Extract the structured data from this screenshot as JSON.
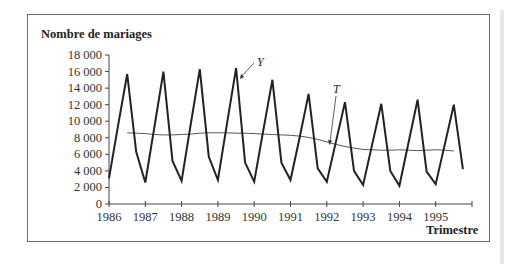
{
  "chart_data": {
    "type": "line",
    "title": "",
    "ylabel": "Nombre de mariages",
    "xlabel": "Trimestre",
    "ylim": [
      0,
      18000
    ],
    "xlim": [
      1986,
      1996
    ],
    "grid": false,
    "legend_position": "inline-annotations",
    "yticks": [
      0,
      2000,
      4000,
      6000,
      8000,
      10000,
      12000,
      14000,
      16000,
      18000
    ],
    "ytick_labels": [
      "0",
      "2 000",
      "4 000",
      "6 000",
      "8 000",
      "10 000",
      "12 000",
      "14 000",
      "16 000",
      "18 000"
    ],
    "xticks": [
      1986,
      1987,
      1988,
      1989,
      1990,
      1991,
      1992,
      1993,
      1994,
      1995,
      1996
    ],
    "xtick_labels": [
      "1986",
      "1987",
      "1988",
      "1989",
      "1990",
      "1991",
      "1992",
      "1993",
      "1994",
      "1995",
      ""
    ],
    "series": [
      {
        "name": "Y",
        "description": "Nombre de mariages trimestriel",
        "start": 1986,
        "step": 0.25,
        "values": [
          3100,
          9500,
          15700,
          6300,
          2600,
          9300,
          16000,
          5200,
          2800,
          9600,
          16300,
          5700,
          2900,
          9700,
          16400,
          5000,
          2700,
          8900,
          15000,
          5000,
          2900,
          8000,
          13300,
          4300,
          2700,
          7500,
          12300,
          4000,
          2300,
          7200,
          12100,
          4000,
          2200,
          7400,
          12600,
          3900,
          2400,
          7200,
          12000,
          4200
        ],
        "color": "#222222",
        "line_width": 2
      },
      {
        "name": "T",
        "description": "Tendance (moyenne mobile)",
        "start": 1986.5,
        "step": 0.25,
        "values": [
          8600,
          8550,
          8500,
          8400,
          8350,
          8350,
          8400,
          8450,
          8550,
          8600,
          8600,
          8600,
          8550,
          8550,
          8500,
          8450,
          8400,
          8350,
          8300,
          8200,
          8050,
          7800,
          7500,
          7200,
          6950,
          6750,
          6600,
          6550,
          6500,
          6500,
          6550,
          6500,
          6450,
          6500,
          6550,
          6500,
          6400
        ],
        "color": "#444444",
        "line_width": 1
      }
    ],
    "annotations": [
      {
        "text": "Y",
        "points_to": "peak 1989 Q3"
      },
      {
        "text": "T",
        "points_to": "trend near 1992 Q1"
      }
    ]
  },
  "labels": {
    "ylabel": "Nombre de mariages",
    "xlabel": "Trimestre",
    "y_series": "Y",
    "t_series": "T"
  }
}
